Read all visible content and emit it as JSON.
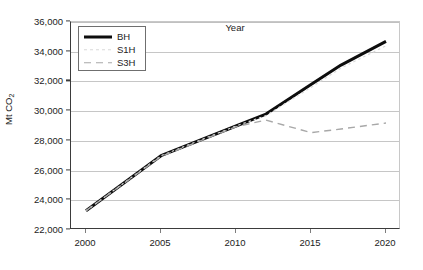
{
  "chart_data": {
    "type": "line",
    "title": "",
    "xlabel": "Year",
    "ylabel": "Mt CO2",
    "ylabel_main": "Mt CO",
    "ylabel_sub": "2",
    "xlim": [
      1999,
      2021
    ],
    "ylim": [
      22000,
      36000
    ],
    "grid": true,
    "legend_position": "top-left-inside",
    "x_ticks": [
      2000,
      2005,
      2010,
      2015,
      2020
    ],
    "x_tick_labels": [
      "2000",
      "2005",
      "2010",
      "2015",
      "2020"
    ],
    "y_ticks": [
      22000,
      24000,
      26000,
      28000,
      30000,
      32000,
      34000,
      36000
    ],
    "y_tick_labels": [
      "22,000",
      "24,000",
      "26,000",
      "28,000",
      "30,000",
      "32,000",
      "34,000",
      "36,000"
    ],
    "x": [
      2000,
      2005,
      2010,
      2012,
      2015,
      2017,
      2020
    ],
    "series": [
      {
        "name": "BH",
        "label": "BH",
        "style": "solid",
        "color": "#0d0d0d",
        "width": 3.0,
        "values": [
          23300,
          27000,
          29000,
          29800,
          31800,
          33100,
          34700
        ]
      },
      {
        "name": "S1H",
        "label": "S1H",
        "style": "dotted",
        "color": "#d9d9d9",
        "width": 1.2,
        "values": [
          23300,
          27000,
          29000,
          29700,
          31600,
          32900,
          34400
        ]
      },
      {
        "name": "S3H",
        "label": "S3H",
        "style": "dashed",
        "color": "#a8a8a8",
        "width": 1.4,
        "values": [
          23300,
          26950,
          28950,
          29400,
          28550,
          28800,
          29200
        ]
      }
    ],
    "annotations": []
  },
  "legend": {
    "entries": [
      {
        "label": "BH"
      },
      {
        "label": "S1H"
      },
      {
        "label": "S3H"
      }
    ]
  }
}
